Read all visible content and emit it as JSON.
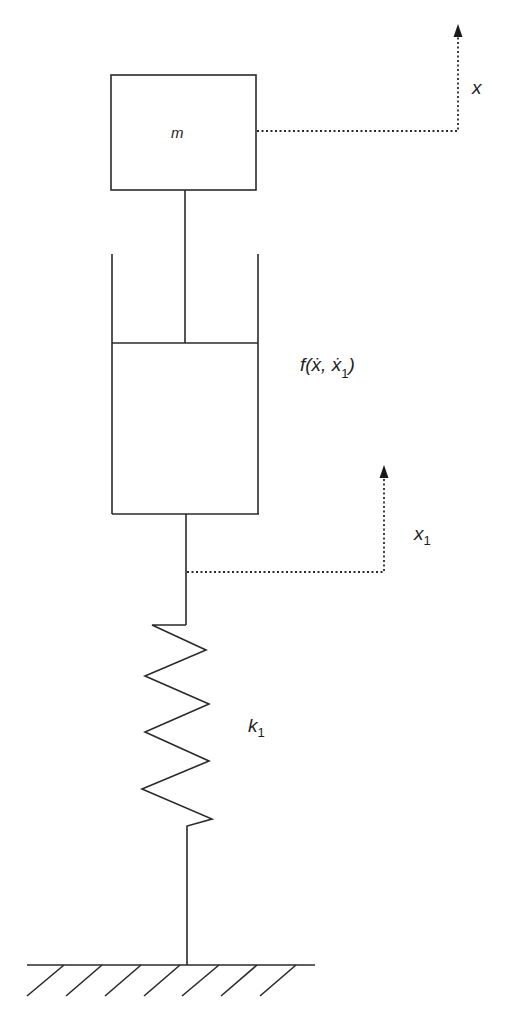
{
  "diagram": {
    "type": "mechanical-schematic",
    "colors": {
      "line": "#2a2a2a",
      "background": "#ffffff"
    },
    "components": {
      "mass": {
        "label": "m"
      },
      "damper": {
        "label_main": "f(ẋ, ẋ",
        "label_sub": "1",
        "label_close": ")"
      },
      "spring": {
        "label_main": "k",
        "label_sub": "1"
      },
      "ground": {
        "hatch_count": 7
      }
    },
    "displacements": {
      "x": {
        "label": "x"
      },
      "x1": {
        "label_main": "x",
        "label_sub": "1"
      }
    }
  }
}
